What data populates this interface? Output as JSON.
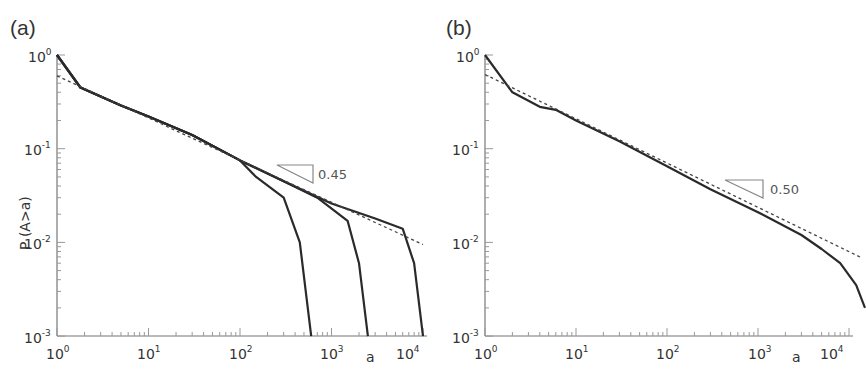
{
  "figure": {
    "panels": [
      {
        "label": "(a)",
        "ylabel": "P (A>a)",
        "xlabel": "a",
        "slope_label": "0.45"
      },
      {
        "label": "(b)",
        "ylabel": "",
        "xlabel": "a",
        "slope_label": "0.50"
      }
    ],
    "x_ticks": [
      "10",
      "10",
      "10",
      "10",
      "10"
    ],
    "x_tick_exps": [
      "0",
      "1",
      "2",
      "3",
      "4"
    ],
    "y_ticks": [
      "10",
      "10",
      "10",
      "10"
    ],
    "y_tick_exps": [
      "0",
      "-1",
      "-2",
      "-3"
    ]
  },
  "chart_data": [
    {
      "type": "line",
      "title": "(a)",
      "xlabel": "a",
      "ylabel": "P (A>a)",
      "xscale": "log",
      "yscale": "log",
      "xlim": [
        1,
        15000
      ],
      "ylim": [
        0.001,
        1
      ],
      "x_tick_labels": [
        "10^0",
        "10^1",
        "10^2",
        "10^3",
        "10^4"
      ],
      "y_tick_labels": [
        "10^0",
        "10^-1",
        "10^-2",
        "10^-3"
      ],
      "annotations": [
        {
          "text": "0.45",
          "type": "slope-triangle",
          "x": 300,
          "y": 0.05
        }
      ],
      "series": [
        {
          "name": "cutoff ~6e2",
          "style": "solid",
          "x": [
            1,
            1.8,
            5,
            10,
            30,
            100,
            150,
            300,
            450,
            600
          ],
          "y": [
            1.0,
            0.45,
            0.29,
            0.22,
            0.14,
            0.075,
            0.05,
            0.03,
            0.01,
            0.001
          ]
        },
        {
          "name": "cutoff ~2.5e3",
          "style": "solid",
          "x": [
            1,
            1.8,
            5,
            10,
            30,
            100,
            300,
            700,
            1500,
            2000,
            2500
          ],
          "y": [
            1.0,
            0.45,
            0.29,
            0.22,
            0.14,
            0.075,
            0.045,
            0.03,
            0.017,
            0.006,
            0.001
          ]
        },
        {
          "name": "cutoff ~1e4",
          "style": "solid",
          "x": [
            1,
            1.8,
            5,
            10,
            30,
            100,
            300,
            1000,
            3000,
            6000,
            8000,
            10000
          ],
          "y": [
            1.0,
            0.45,
            0.29,
            0.22,
            0.14,
            0.075,
            0.045,
            0.026,
            0.018,
            0.014,
            0.006,
            0.001
          ]
        },
        {
          "name": "power-law fit (slope 0.45)",
          "style": "dotted",
          "x": [
            1,
            10000
          ],
          "y": [
            0.6,
            0.0095
          ]
        }
      ]
    },
    {
      "type": "line",
      "title": "(b)",
      "xlabel": "a",
      "ylabel": "",
      "xscale": "log",
      "yscale": "log",
      "xlim": [
        1,
        15000
      ],
      "ylim": [
        0.001,
        1
      ],
      "x_tick_labels": [
        "10^0",
        "10^1",
        "10^2",
        "10^3",
        "10^4"
      ],
      "y_tick_labels": [
        "10^0",
        "10^-1",
        "10^-2",
        "10^-3"
      ],
      "annotations": [
        {
          "text": "0.50",
          "type": "slope-triangle",
          "x": 2000,
          "y": 0.025
        }
      ],
      "series": [
        {
          "name": "data",
          "style": "solid",
          "x": [
            1,
            2,
            4,
            6,
            10,
            30,
            100,
            300,
            1000,
            3000,
            5000,
            8000,
            12000,
            15000
          ],
          "y": [
            1.0,
            0.4,
            0.28,
            0.26,
            0.2,
            0.12,
            0.065,
            0.037,
            0.021,
            0.012,
            0.0085,
            0.006,
            0.0035,
            0.002
          ]
        },
        {
          "name": "power-law fit (slope 0.50)",
          "style": "dotted",
          "x": [
            1,
            14000
          ],
          "y": [
            0.62,
            0.0068
          ]
        }
      ]
    }
  ]
}
